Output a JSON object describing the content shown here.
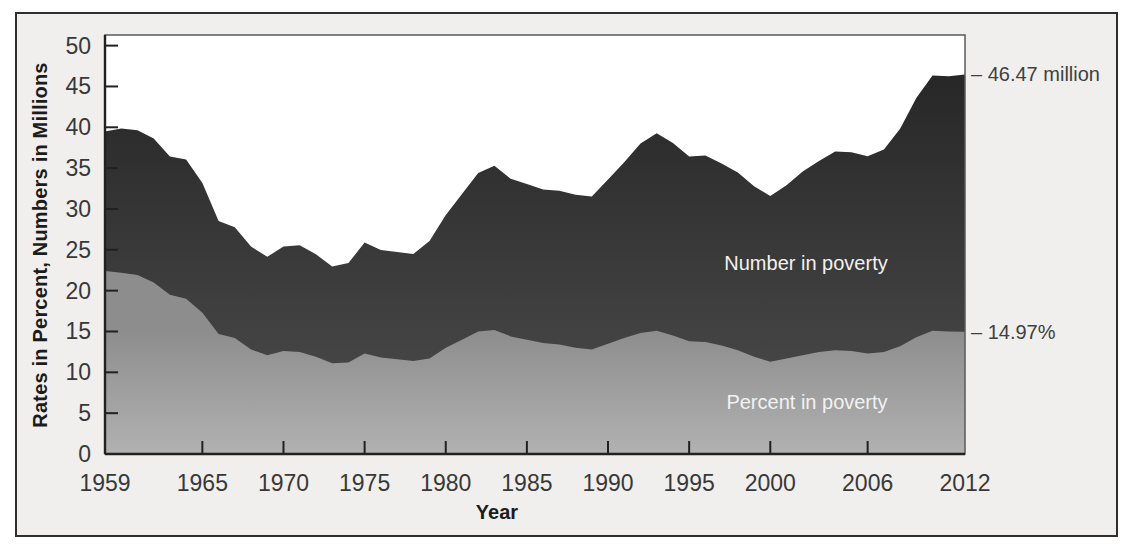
{
  "page": {
    "background": "#ffffff"
  },
  "figure": {
    "background": "#f0efed",
    "border_color": "#2f2f2f"
  },
  "chart_data": {
    "type": "area",
    "title": "",
    "xlabel": "Year",
    "ylabel": "Rates in Percent, Numbers in Millions",
    "xlim": [
      1959,
      2012
    ],
    "ylim": [
      0,
      51.3
    ],
    "grid": false,
    "legend_position": "labels-inside-areas",
    "axis_color": "#212121",
    "tick_label_color": "#383838",
    "x_ticks": [
      1959,
      1965,
      1970,
      1975,
      1980,
      1985,
      1990,
      1995,
      2000,
      2006,
      2012
    ],
    "x_tick_marks": [
      1965,
      1970,
      1975,
      1980,
      1985,
      1990,
      1995,
      2000,
      2006
    ],
    "y_ticks": [
      0,
      5,
      10,
      15,
      20,
      25,
      30,
      35,
      40,
      45,
      50
    ],
    "x": [
      1959,
      1960,
      1961,
      1962,
      1963,
      1964,
      1965,
      1966,
      1967,
      1968,
      1969,
      1970,
      1971,
      1972,
      1973,
      1974,
      1975,
      1976,
      1977,
      1978,
      1979,
      1980,
      1981,
      1982,
      1983,
      1984,
      1985,
      1986,
      1987,
      1988,
      1989,
      1990,
      1991,
      1992,
      1993,
      1994,
      1995,
      1996,
      1997,
      1998,
      1999,
      2000,
      2001,
      2002,
      2003,
      2004,
      2005,
      2006,
      2007,
      2008,
      2009,
      2010,
      2011,
      2012
    ],
    "series": [
      {
        "name": "Number in poverty",
        "unit": "millions",
        "fill_top": "#232323",
        "fill_bottom": "#4e4e4e",
        "label_color": "#f2f2f2",
        "values": [
          39.49,
          39.85,
          39.63,
          38.63,
          36.44,
          36.06,
          33.19,
          28.51,
          27.77,
          25.39,
          24.15,
          25.42,
          25.56,
          24.46,
          22.97,
          23.37,
          25.88,
          24.98,
          24.72,
          24.5,
          26.07,
          29.27,
          31.82,
          34.4,
          35.3,
          33.7,
          33.06,
          32.37,
          32.22,
          31.75,
          31.53,
          33.59,
          35.71,
          38.01,
          39.27,
          38.06,
          36.43,
          36.53,
          35.57,
          34.48,
          32.79,
          31.58,
          32.91,
          34.57,
          35.86,
          37.04,
          36.95,
          36.46,
          37.28,
          39.83,
          43.57,
          46.34,
          46.25,
          46.47
        ]
      },
      {
        "name": "Percent in poverty",
        "unit": "percent",
        "fill_top": "#8d8d8d",
        "fill_bottom": "#b6b6b6",
        "label_color": "#f2f2f2",
        "values": [
          22.4,
          22.2,
          21.9,
          21.0,
          19.5,
          19.0,
          17.3,
          14.7,
          14.2,
          12.8,
          12.1,
          12.6,
          12.5,
          11.9,
          11.1,
          11.2,
          12.3,
          11.8,
          11.6,
          11.4,
          11.7,
          13.0,
          14.0,
          15.0,
          15.2,
          14.4,
          14.0,
          13.6,
          13.4,
          13.0,
          12.8,
          13.5,
          14.2,
          14.8,
          15.1,
          14.5,
          13.8,
          13.7,
          13.3,
          12.7,
          11.9,
          11.3,
          11.7,
          12.1,
          12.5,
          12.7,
          12.6,
          12.3,
          12.5,
          13.2,
          14.3,
          15.1,
          15.0,
          14.97
        ]
      }
    ],
    "annotations": [
      {
        "text": "– 46.47 million",
        "value": 46.47,
        "series": "Number in poverty"
      },
      {
        "text": "– 14.97%",
        "value": 14.97,
        "series": "Percent in poverty"
      }
    ]
  }
}
